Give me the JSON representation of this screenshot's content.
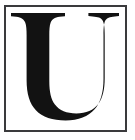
{
  "image": {
    "kind": "trademark-letter-mark",
    "width": 135,
    "height": 140,
    "background_color": "#ffffff"
  },
  "frame": {
    "border_color": "#3a3a3c",
    "border_width": 2,
    "fill_color": "#ffffff"
  },
  "mark": {
    "letter": "U",
    "style": "didone-serif-capital",
    "color": "#121212",
    "alt": "U"
  }
}
